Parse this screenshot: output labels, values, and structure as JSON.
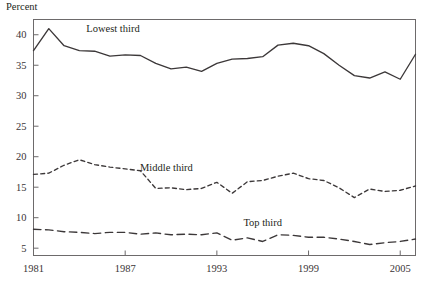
{
  "chart_data": {
    "type": "line",
    "title": "",
    "ylabel": "Percent",
    "xlabel": "",
    "ylim": [
      3.8,
      42.5
    ],
    "xlim": [
      1981,
      2006
    ],
    "grid": false,
    "legend": "inline-labels",
    "yticks": [
      5,
      10,
      15,
      20,
      25,
      30,
      35,
      40
    ],
    "ytick_labels": [
      "5",
      "10",
      "15",
      "20",
      "25",
      "30",
      "35",
      "40"
    ],
    "xticks": [
      1981,
      1987,
      1993,
      1999,
      2005
    ],
    "xtick_labels": [
      "1981",
      "1987",
      "1993",
      "1999",
      "2005"
    ],
    "x": [
      1981,
      1982,
      1983,
      1984,
      1985,
      1986,
      1987,
      1988,
      1989,
      1990,
      1991,
      1992,
      1993,
      1994,
      1995,
      1996,
      1997,
      1998,
      1999,
      2000,
      2001,
      2002,
      2003,
      2004,
      2005,
      2006
    ],
    "series": [
      {
        "name": "Lowest third",
        "style": "solid",
        "label_x": 1986.2,
        "label_y": 40.4,
        "values": [
          37.4,
          41.0,
          38.2,
          37.4,
          37.3,
          36.5,
          36.7,
          36.6,
          35.3,
          34.4,
          34.7,
          34.0,
          35.3,
          36.0,
          36.1,
          36.4,
          38.3,
          38.6,
          38.2,
          36.9,
          35.0,
          33.3,
          32.9,
          33.9,
          32.7,
          36.8
        ]
      },
      {
        "name": "Middle third",
        "style": "dashed-short",
        "label_x": 1989.7,
        "label_y": 17.6,
        "values": [
          17.1,
          17.3,
          18.6,
          19.5,
          18.7,
          18.3,
          18.0,
          17.7,
          14.8,
          14.9,
          14.6,
          14.8,
          15.8,
          14.0,
          15.9,
          16.1,
          16.8,
          17.3,
          16.4,
          16.1,
          14.9,
          13.3,
          14.7,
          14.3,
          14.5,
          15.2
        ]
      },
      {
        "name": "Top third",
        "style": "dashed-long",
        "label_x": 1996.0,
        "label_y": 8.6,
        "values": [
          8.1,
          8.0,
          7.7,
          7.6,
          7.4,
          7.6,
          7.6,
          7.3,
          7.5,
          7.2,
          7.3,
          7.2,
          7.5,
          6.3,
          6.7,
          6.1,
          7.2,
          7.1,
          6.8,
          6.8,
          6.5,
          6.1,
          5.6,
          5.9,
          6.1,
          6.5
        ]
      }
    ]
  }
}
